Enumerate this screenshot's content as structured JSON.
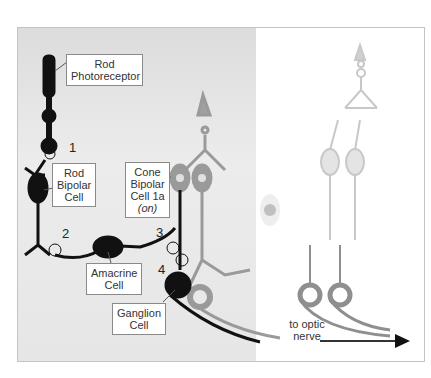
{
  "figure": {
    "labels": {
      "rod_photoreceptor": [
        "Rod",
        "Photoreceptor"
      ],
      "rod_bipolar": [
        "Rod",
        "Bipolar",
        "Cell"
      ],
      "cone_bipolar": [
        "Cone",
        "Bipolar",
        "Cell 1a",
        "(on)"
      ],
      "amacrine": [
        "Amacrine",
        "Cell"
      ],
      "ganglion": [
        "Ganglion",
        "Cell"
      ],
      "optic_nerve": [
        "to optic",
        "nerve"
      ]
    },
    "synapse_numbers": [
      "1",
      "2",
      "3",
      "4"
    ],
    "colors": {
      "rod_pathway": "#111111",
      "cone_pathway": "#9a9a9a",
      "faded_pathway": "#c8c8c8",
      "panel_shade": "#e4e4e4"
    }
  }
}
